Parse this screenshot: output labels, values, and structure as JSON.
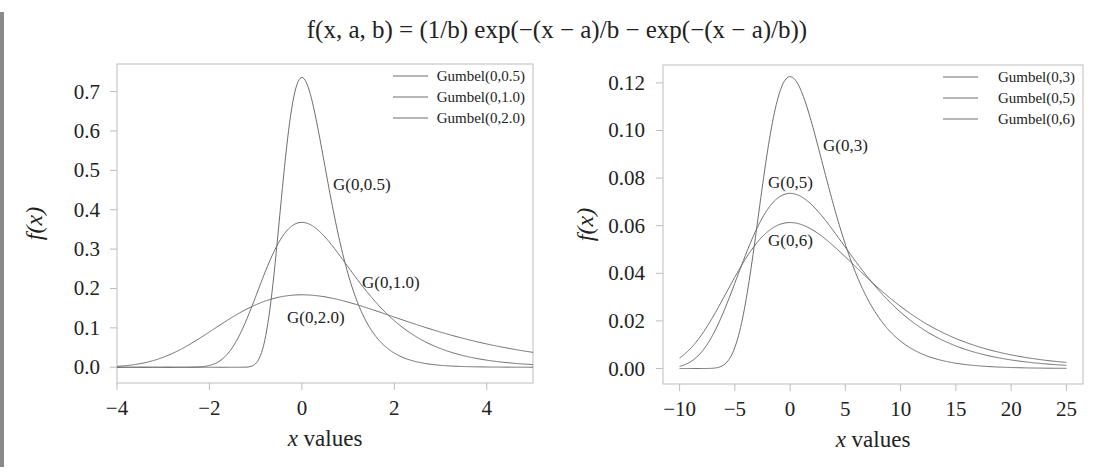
{
  "title": "f(x, a, b) = (1/b) exp(−(x − a)/b − exp(−(x − a)/b))",
  "colors": {
    "curve": "#6e6e6e",
    "frame": "#bdbdbd",
    "text": "#222222"
  },
  "chart_data": [
    {
      "type": "line",
      "title": "",
      "xlabel": "x values",
      "ylabel": "f(x)",
      "xlim": [
        -4,
        5
      ],
      "ylim": [
        -0.04,
        0.77
      ],
      "xticks": [
        -4,
        -2,
        0,
        2,
        4
      ],
      "xtick_labels": [
        "−4",
        "−2",
        "0",
        "2",
        "4"
      ],
      "yticks": [
        0.0,
        0.1,
        0.2,
        0.3,
        0.4,
        0.5,
        0.6,
        0.7
      ],
      "ytick_labels": [
        "0.0",
        "0.1",
        "0.2",
        "0.3",
        "0.4",
        "0.5",
        "0.6",
        "0.7"
      ],
      "grid": false,
      "legend_position": "upper right",
      "series": [
        {
          "name": "Gumbel(0,0.5)",
          "a": 0,
          "b": 0.5,
          "peak": 0.736,
          "annotation": "G(0,0.5)"
        },
        {
          "name": "Gumbel(0,1.0)",
          "a": 0,
          "b": 1.0,
          "peak": 0.368,
          "annotation": "G(0,1.0)"
        },
        {
          "name": "Gumbel(0,2.0)",
          "a": 0,
          "b": 2.0,
          "peak": 0.184,
          "annotation": "G(0,2.0)"
        }
      ],
      "x_range_plotted": [
        -4,
        5
      ]
    },
    {
      "type": "line",
      "title": "",
      "xlabel": "x values",
      "ylabel": "f(x)",
      "xlim": [
        -11.5,
        26.5
      ],
      "ylim": [
        -0.0065,
        0.1275
      ],
      "xticks": [
        -10,
        -5,
        0,
        5,
        10,
        15,
        20,
        25
      ],
      "xtick_labels": [
        "−10",
        "−5",
        "0",
        "5",
        "10",
        "15",
        "20",
        "25"
      ],
      "yticks": [
        0.0,
        0.02,
        0.04,
        0.06,
        0.08,
        0.1,
        0.12
      ],
      "ytick_labels": [
        "0.00",
        "0.02",
        "0.04",
        "0.06",
        "0.08",
        "0.10",
        "0.12"
      ],
      "grid": false,
      "legend_position": "upper right",
      "series": [
        {
          "name": "Gumbel(0,3)",
          "a": 0,
          "b": 3,
          "peak": 0.123,
          "annotation": "G(0,3)"
        },
        {
          "name": "Gumbel(0,5)",
          "a": 0,
          "b": 5,
          "peak": 0.074,
          "annotation": "G(0,5)"
        },
        {
          "name": "Gumbel(0,6)",
          "a": 0,
          "b": 6,
          "peak": 0.061,
          "annotation": "G(0,6)"
        }
      ],
      "x_range_plotted": [
        -10,
        25
      ]
    }
  ]
}
